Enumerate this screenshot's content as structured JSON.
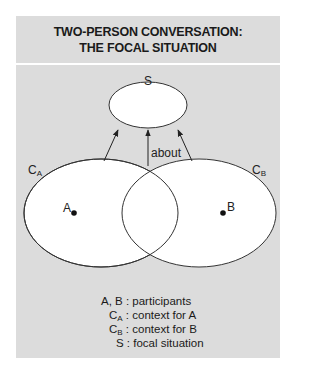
{
  "title": {
    "line1": "TWO-PERSON CONVERSATION:",
    "line2": "THE FOCAL SITUATION"
  },
  "diagram": {
    "nodes": {
      "S": {
        "label": "S"
      },
      "CA": {
        "label": "C",
        "sub": "A"
      },
      "CB": {
        "label": "C",
        "sub": "B"
      },
      "A": {
        "label": "A"
      },
      "B": {
        "label": "B"
      }
    },
    "edge_label": "about"
  },
  "legend": [
    {
      "key": "A, B",
      "key_sub": "",
      "sep": " : ",
      "text": "participants"
    },
    {
      "key": "C",
      "key_sub": "A",
      "sep": " : ",
      "text": "context for A"
    },
    {
      "key": "C",
      "key_sub": "B",
      "sep": " : ",
      "text": "context for B"
    },
    {
      "key": "S",
      "key_sub": "",
      "sep": " : ",
      "text": "focal situation"
    }
  ],
  "colors": {
    "panel": "#dcdcdc",
    "shape_fill": "#ffffff",
    "stroke": "#333333"
  }
}
